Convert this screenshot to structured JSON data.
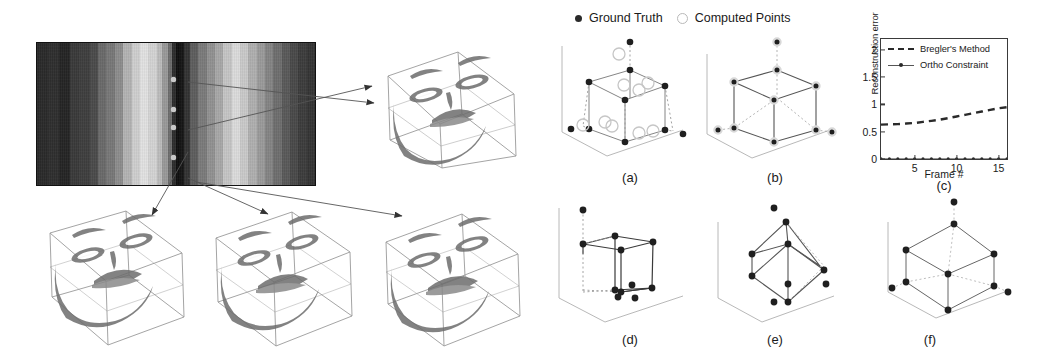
{
  "figure": {
    "left_panel": {
      "name": "Structured light stripe image with 3D face reconstructions",
      "stripe_image": {
        "label": "striped-grayscale-input-image",
        "marker_points": [
          {
            "x": 0.497,
            "y": 0.27
          },
          {
            "x": 0.497,
            "y": 0.47
          },
          {
            "x": 0.497,
            "y": 0.6
          },
          {
            "x": 0.497,
            "y": 0.8
          }
        ],
        "band_stops": [
          {
            "pos": 0,
            "gray": "#2a2a2a"
          },
          {
            "pos": 4,
            "gray": "#2f2f2f"
          },
          {
            "pos": 8,
            "gray": "#252525"
          },
          {
            "pos": 12,
            "gray": "#3a3a3a"
          },
          {
            "pos": 15,
            "gray": "#3f3f3f"
          },
          {
            "pos": 19,
            "gray": "#4b4b4b"
          },
          {
            "pos": 22,
            "gray": "#6a6a6a"
          },
          {
            "pos": 25,
            "gray": "#787878"
          },
          {
            "pos": 28,
            "gray": "#8d8d8d"
          },
          {
            "pos": 31,
            "gray": "#b4b4b4"
          },
          {
            "pos": 34,
            "gray": "#cfcfcf"
          },
          {
            "pos": 37,
            "gray": "#e2e2e2"
          },
          {
            "pos": 40,
            "gray": "#d4d4d4"
          },
          {
            "pos": 43,
            "gray": "#bcbcbc"
          },
          {
            "pos": 45,
            "gray": "#9a9a9a"
          },
          {
            "pos": 47,
            "gray": "#6d6d6d"
          },
          {
            "pos": 48.5,
            "gray": "#2d2d2d"
          },
          {
            "pos": 50,
            "gray": "#101010"
          },
          {
            "pos": 51.5,
            "gray": "#161616"
          },
          {
            "pos": 53,
            "gray": "#333333"
          },
          {
            "pos": 55,
            "gray": "#5e5e5e"
          },
          {
            "pos": 58,
            "gray": "#7b7b7b"
          },
          {
            "pos": 61,
            "gray": "#929292"
          },
          {
            "pos": 64,
            "gray": "#a8a8a8"
          },
          {
            "pos": 67,
            "gray": "#c6c6c6"
          },
          {
            "pos": 70,
            "gray": "#dcdcdc"
          },
          {
            "pos": 73,
            "gray": "#cacaca"
          },
          {
            "pos": 76,
            "gray": "#b0b0b0"
          },
          {
            "pos": 79,
            "gray": "#9b9b9b"
          },
          {
            "pos": 82,
            "gray": "#858585"
          },
          {
            "pos": 85,
            "gray": "#6f6f6f"
          },
          {
            "pos": 88,
            "gray": "#5a5a5a"
          },
          {
            "pos": 91,
            "gray": "#4a4a4a"
          },
          {
            "pos": 94,
            "gray": "#3d3d3d"
          },
          {
            "pos": 97,
            "gray": "#353535"
          },
          {
            "pos": 100,
            "gray": "#2e2e2e"
          }
        ]
      },
      "face_reconstructions": [
        {
          "name": "face-box-top-right",
          "label": ""
        },
        {
          "name": "face-box-bottom-left",
          "label": ""
        },
        {
          "name": "face-box-bottom-mid",
          "label": ""
        },
        {
          "name": "face-box-bottom-right",
          "label": ""
        }
      ],
      "arrow_count": 4
    },
    "right_panel": {
      "points_legend": {
        "ground_truth_label": "Ground Truth",
        "computed_points_label": "Computed Points"
      },
      "cube_panels": [
        {
          "id": "a",
          "caption": "(a)",
          "name": "cube-panel-a",
          "desc": "cube with computed points offset from ground truth"
        },
        {
          "id": "b",
          "caption": "(b)",
          "name": "cube-panel-b",
          "desc": "cube with computed points coincident with ground truth"
        },
        {
          "id": "d",
          "caption": "(d)",
          "name": "cube-panel-d",
          "desc": "collapsed / degenerate cube reconstruction"
        },
        {
          "id": "e",
          "caption": "(e)",
          "name": "cube-panel-e",
          "desc": "sheared cube reconstruction"
        },
        {
          "id": "f",
          "caption": "(f)",
          "name": "cube-panel-f",
          "desc": "correct cube reconstruction"
        }
      ],
      "chart_caption": "(c)"
    }
  },
  "chart_data": {
    "type": "line",
    "title": "",
    "caption": "(c)",
    "xlabel": "Frame #",
    "ylabel": "Reconstruction error",
    "xlim": [
      1,
      16
    ],
    "ylim": [
      0,
      2.2
    ],
    "xticks": [
      5,
      10,
      15
    ],
    "yticks": [
      0,
      0.5,
      1,
      1.5,
      2
    ],
    "ytick_labels": [
      "0",
      "0.5",
      "1",
      "1.5",
      "2"
    ],
    "grid": false,
    "legend_position": "upper-left-inside",
    "x": [
      1,
      2,
      3,
      4,
      5,
      6,
      7,
      8,
      9,
      10,
      11,
      12,
      13,
      14,
      15,
      16
    ],
    "series": [
      {
        "name": "Bregler's Method",
        "style": "dashed",
        "color": "#2a2a2a",
        "values": [
          0.63,
          0.635,
          0.64,
          0.65,
          0.66,
          0.68,
          0.7,
          0.72,
          0.75,
          0.78,
          0.81,
          0.84,
          0.87,
          0.9,
          0.93,
          0.95
        ]
      },
      {
        "name": "Ortho Constraint",
        "style": "solid-with-markers",
        "color": "#2a2a2a",
        "values": [
          0,
          0,
          0,
          0,
          0,
          0,
          0,
          0,
          0,
          0,
          0,
          0,
          0,
          0,
          0,
          0
        ]
      }
    ]
  }
}
